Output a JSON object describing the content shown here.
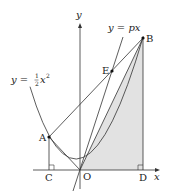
{
  "diagram": {
    "type": "coordinate-geometry",
    "axes": {
      "x_label": "x",
      "y_label": "y",
      "origin_label": "O"
    },
    "curves": [
      {
        "id": "parabola",
        "label_lhs": "y = ",
        "label_frac_num": "1",
        "label_frac_den": "2",
        "label_var": "x",
        "label_exp": "2",
        "equation": "y = 1/2 x^2"
      },
      {
        "id": "line-px",
        "label": "y = px",
        "equation": "y = px"
      }
    ],
    "points": [
      {
        "name": "A",
        "label": "A"
      },
      {
        "name": "B",
        "label": "B"
      },
      {
        "name": "C",
        "label": "C"
      },
      {
        "name": "D",
        "label": "D"
      },
      {
        "name": "E",
        "label": "E"
      },
      {
        "name": "O",
        "label": "O"
      }
    ],
    "segments": [
      "AB",
      "AC",
      "BD",
      "OA",
      "OB"
    ],
    "shaded_region": "triangle OBD",
    "right_angles": [
      "C",
      "D"
    ],
    "colors": {
      "line": "#333333",
      "shade": "#e2e2e2",
      "point": "#111111"
    }
  }
}
